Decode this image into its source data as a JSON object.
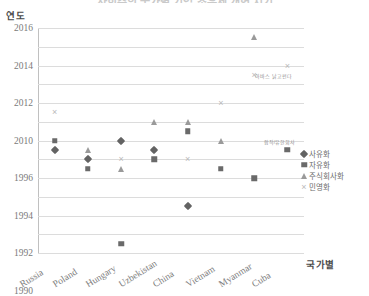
{
  "title": "사회주의 국가별 기업 소유제 개혁 시기",
  "axis": {
    "y_title": "연도",
    "x_title": "국가별"
  },
  "legend": [
    {
      "label": "사유화",
      "marker": "diamond"
    },
    {
      "label": "자유화",
      "marker": "square"
    },
    {
      "label": "주식회사화",
      "marker": "triangle"
    },
    {
      "label": "민영화",
      "marker": "cross"
    }
  ],
  "chart_data": {
    "type": "scatter",
    "title": "사회주의 국가별 기업 소유제 개혁 시기",
    "xlabel": "국가별",
    "ylabel": "연도",
    "grid": true,
    "legend_position": "right",
    "categories": [
      "Russia",
      "Poland",
      "Hungary",
      "Uzbekistan",
      "China",
      "Vietnam",
      "Myanmar",
      "Cuba"
    ],
    "ytick_labels": [
      "2016",
      "2014",
      "2012",
      "2010",
      "1996",
      "1994",
      "1992",
      "1990",
      "1988",
      "1986",
      "1984",
      "1982",
      "1980"
    ],
    "y_axis_note": "축 눈금은 2010과 1996 사이가 끊어져 있음",
    "series": [
      {
        "name": "사유화",
        "marker": "diamond",
        "points": [
          {
            "country": "Russia",
            "year": 1991
          },
          {
            "country": "Poland",
            "year": 1990
          },
          {
            "country": "Hungary",
            "year": 1992
          },
          {
            "country": "Uzbekistan",
            "year": 1991
          },
          {
            "country": "China",
            "year": 1985
          }
        ]
      },
      {
        "name": "자유화",
        "marker": "square",
        "points": [
          {
            "country": "Russia",
            "year": 1992
          },
          {
            "country": "Poland",
            "year": 1989
          },
          {
            "country": "Hungary",
            "year": 1981
          },
          {
            "country": "Uzbekistan",
            "year": 1990
          },
          {
            "country": "China",
            "year": 1993
          },
          {
            "country": "Vietnam",
            "year": 1989
          },
          {
            "country": "Myanmar",
            "year": 1988
          },
          {
            "country": "Cuba",
            "year": 1991
          }
        ]
      },
      {
        "name": "주식회사화",
        "marker": "triangle",
        "points": [
          {
            "country": "Poland",
            "year": 1991
          },
          {
            "country": "Hungary",
            "year": 1989
          },
          {
            "country": "Uzbekistan",
            "year": 1994
          },
          {
            "country": "China",
            "year": 1994
          },
          {
            "country": "Vietnam",
            "year": 1992
          },
          {
            "country": "Myanmar",
            "year": 2015
          }
        ]
      },
      {
        "name": "민영화",
        "marker": "cross",
        "points": [
          {
            "country": "Russia",
            "year": 1995
          },
          {
            "country": "Hungary",
            "year": 1990
          },
          {
            "country": "China",
            "year": 1990
          },
          {
            "country": "Vietnam",
            "year": 1996
          },
          {
            "country": "Myanmar",
            "year": 2011
          },
          {
            "country": "Cuba",
            "year": 2012
          }
        ]
      }
    ],
    "annotations": [
      {
        "text": "아바스 낡고펀다",
        "country": "Cuba",
        "year": 2011,
        "dx": -14
      },
      {
        "text": "합작/유한회사",
        "country": "Cuba",
        "year": 1992,
        "dx": -8
      }
    ]
  }
}
